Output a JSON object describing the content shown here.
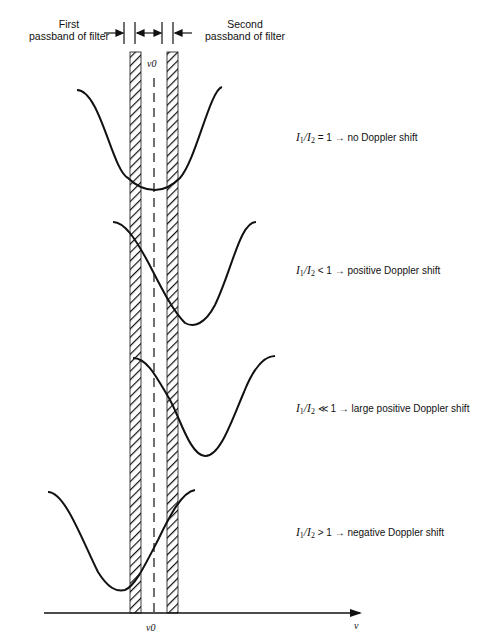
{
  "header": {
    "first_line1": "First",
    "first_line2": "passband of filter",
    "second_line1": "Second",
    "second_line2": "passband of filter"
  },
  "center_label": "ν0",
  "axis": {
    "x_label": "ν",
    "center_tick_label": "ν0"
  },
  "cases": [
    {
      "ratio_symbol": "=",
      "value": "1",
      "arrow": "→",
      "result": "no Doppler shift"
    },
    {
      "ratio_symbol": "<",
      "value": "1",
      "arrow": "→",
      "result": "positive Doppler shift"
    },
    {
      "ratio_symbol": "≪",
      "value": "1",
      "arrow": "→",
      "result": "large positive Doppler shift"
    },
    {
      "ratio_symbol": ">",
      "value": "1",
      "arrow": "→",
      "result": "negative Doppler shift"
    }
  ],
  "ratio": {
    "I": "I",
    "s1": "1",
    "slash": "/",
    "s2": "2"
  },
  "colors": {
    "ink": "#111111",
    "background": "#ffffff"
  }
}
